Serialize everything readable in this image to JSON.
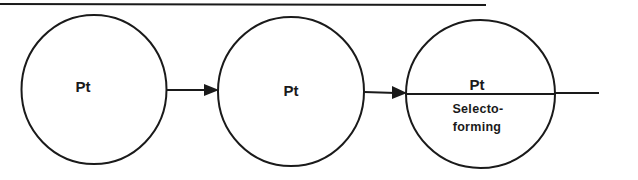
{
  "diagram": {
    "type": "reactor-sequence",
    "colors": {
      "line": "#1a1a1a",
      "background": "#ffffff"
    },
    "reactors": [
      {
        "id": "reactor-1",
        "label": "Pt"
      },
      {
        "id": "reactor-2",
        "label": "Pt"
      },
      {
        "id": "reactor-3",
        "label": "Pt",
        "sublabel_line1": "Selecto-",
        "sublabel_line2": "forming"
      }
    ],
    "connections": [
      {
        "from": "reactor-1",
        "to": "reactor-2",
        "arrow": true
      },
      {
        "from": "reactor-2",
        "to": "reactor-3",
        "arrow": true
      },
      {
        "from": "reactor-3",
        "to": "outlet",
        "arrow": false
      }
    ]
  }
}
